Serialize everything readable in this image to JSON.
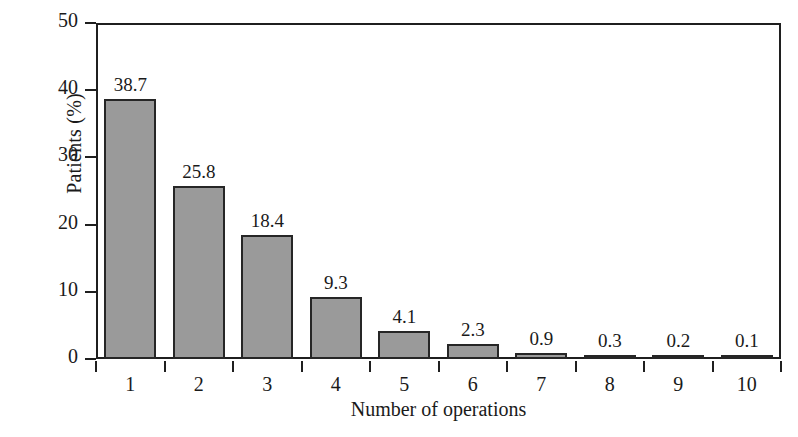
{
  "chart_data": {
    "type": "bar",
    "title": "",
    "subtitle": "",
    "xlabel": "Number of operations",
    "ylabel": "Patients (%)",
    "categories": [
      "1",
      "2",
      "3",
      "4",
      "5",
      "6",
      "7",
      "8",
      "9",
      "10"
    ],
    "values": [
      38.7,
      25.8,
      18.4,
      9.3,
      4.1,
      2.3,
      0.9,
      0.3,
      0.2,
      0.1
    ],
    "value_labels": [
      "38.7",
      "25.8",
      "18.4",
      "9.3",
      "4.1",
      "2.3",
      "0.9",
      "0.3",
      "0.2",
      "0.1"
    ],
    "ylim": [
      0,
      50
    ],
    "y_ticks": [
      0,
      10,
      20,
      30,
      40,
      50
    ],
    "y_tick_labels": [
      "0",
      "10",
      "20",
      "30",
      "40",
      "50"
    ],
    "xlim_slots": 10,
    "grid": false,
    "legend": null,
    "legend_position": "none",
    "series": [
      {
        "name": "Patients (%)",
        "values": [
          38.7,
          25.8,
          18.4,
          9.3,
          4.1,
          2.3,
          0.9,
          0.3,
          0.2,
          0.1
        ],
        "bar_fill_color": "#9a9a9a",
        "bar_edge_color": "#262626"
      }
    ],
    "axis_color": "#1f1f1f",
    "background_color": "#ffffff",
    "annotations": []
  }
}
